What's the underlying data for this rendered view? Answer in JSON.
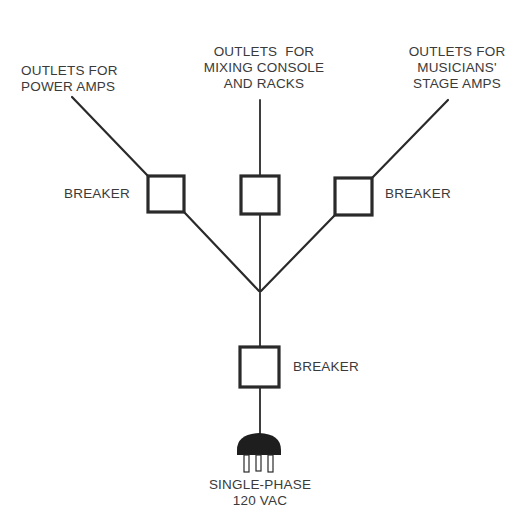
{
  "diagram": {
    "type": "power distribution tree",
    "colors": {
      "line": "#2a2a2a",
      "text": "#3a3a3a",
      "background": "#ffffff"
    },
    "outlets": {
      "left": {
        "lines": [
          "OUTLETS FOR",
          "POWER AMPS"
        ]
      },
      "center": {
        "lines": [
          "OUTLETS  FOR",
          "MIXING CONSOLE",
          "AND RACKS"
        ]
      },
      "right": {
        "lines": [
          "OUTLETS FOR",
          "MUSICIANS'",
          "STAGE AMPS"
        ]
      }
    },
    "breakers": {
      "left": {
        "label": "BREAKER"
      },
      "right": {
        "label": "BREAKER"
      },
      "main": {
        "label": "BREAKER"
      }
    },
    "source": {
      "lines": [
        "SINGLE-PHASE",
        "120 VAC"
      ],
      "icon": "power-plug-icon"
    }
  }
}
